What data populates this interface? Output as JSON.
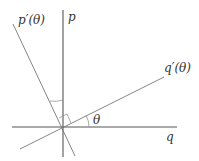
{
  "diagram": {
    "type": "coordinate-rotation",
    "labels": {
      "p": "p",
      "q": "q",
      "p_prime": "p′(θ)",
      "q_prime": "q′(θ)",
      "theta": "θ"
    },
    "colors": {
      "axis": "#555555",
      "rotated_axis": "#777777",
      "text": "#333333"
    },
    "geometry": {
      "origin": [
        63,
        127
      ],
      "q_axis": {
        "from": [
          12,
          127
        ],
        "to": [
          177,
          127
        ]
      },
      "p_axis": {
        "from": [
          63,
          10
        ],
        "to": [
          63,
          157
        ]
      },
      "q_prime_axis": {
        "from": [
          20,
          150
        ],
        "to": [
          164,
          77
        ]
      },
      "p_prime_axis": {
        "from": [
          13,
          24
        ],
        "to": [
          75,
          157
        ]
      }
    }
  }
}
